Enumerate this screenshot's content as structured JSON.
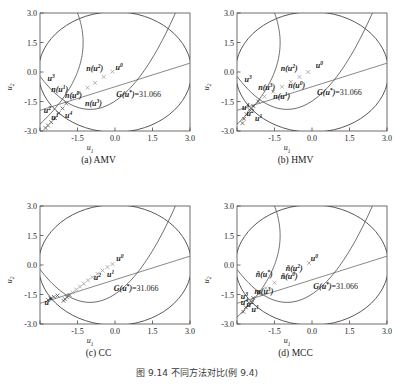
{
  "figure": {
    "caption": "图 9.14   不同方法对比(例 9.4)",
    "colors": {
      "axis": "#4a4a4a",
      "circle": "#3a3a3a",
      "limit_line": "#6b6b6b",
      "curve": "#555555",
      "marker_gray": "#9a9a9a",
      "marker_dark": "#4a4a4a",
      "text": "#1a1a1a"
    }
  },
  "axes": {
    "xlabel": "u1",
    "ylabel": "u2",
    "xticks": [
      "-3.0",
      "-1.5",
      "0.0",
      "1.5",
      "3.0"
    ],
    "yticks": [
      "3.0",
      "1.5",
      "0.0",
      "-1.5",
      "-3.0"
    ],
    "xlim": [
      -3.0,
      3.0
    ],
    "ylim": [
      -3.0,
      3.0
    ]
  },
  "panels": [
    {
      "id": "a",
      "caption": "(a) AMV",
      "glabel": "G(u*)=31.066",
      "glabel_pos": [
        0.05,
        -1.25
      ],
      "markers": [
        {
          "x": -0.1,
          "y": 0.02,
          "type": "cross",
          "tone": "gray"
        },
        {
          "x": -0.45,
          "y": -0.25,
          "type": "cross",
          "tone": "gray"
        },
        {
          "x": -0.8,
          "y": -0.55,
          "type": "cross",
          "tone": "gray"
        },
        {
          "x": -1.1,
          "y": -0.8,
          "type": "cross",
          "tone": "gray"
        },
        {
          "x": -1.45,
          "y": -1.05,
          "type": "cross",
          "tone": "gray"
        },
        {
          "x": -1.7,
          "y": -1.3,
          "type": "cross",
          "tone": "gray"
        },
        {
          "x": -1.95,
          "y": -1.6,
          "type": "cross",
          "tone": "dark"
        },
        {
          "x": -2.1,
          "y": -1.85,
          "type": "cross",
          "tone": "dark"
        },
        {
          "x": -2.25,
          "y": -2.1,
          "type": "cross",
          "tone": "dark"
        },
        {
          "x": -2.4,
          "y": -2.35,
          "type": "cross",
          "tone": "dark"
        },
        {
          "x": -2.55,
          "y": -2.55,
          "type": "cross",
          "tone": "dark"
        },
        {
          "x": -2.68,
          "y": -2.72,
          "type": "cross",
          "tone": "dark"
        },
        {
          "x": -2.78,
          "y": -2.85,
          "type": "cross",
          "tone": "dark"
        }
      ],
      "labels": [
        {
          "text": "u",
          "sup": "0",
          "x": 0.02,
          "y": 0.1
        },
        {
          "text": "n(u",
          "sup": "2",
          "close": ")",
          "x": -1.15,
          "y": 0.05
        },
        {
          "text": "u",
          "sup": "3",
          "x": -2.7,
          "y": -0.45
        },
        {
          "text": "n(u",
          "sup": "1",
          "close": ")",
          "x": -2.55,
          "y": -1.0
        },
        {
          "text": "n(u",
          "sup": "0",
          "close": ")",
          "x": -2.0,
          "y": -1.3
        },
        {
          "text": "n(u",
          "sup": "3",
          "close": ")",
          "x": -1.2,
          "y": -1.75
        },
        {
          "text": "u",
          "sup": "2",
          "x": -2.85,
          "y": -2.1
        },
        {
          "text": "u",
          "sup": "1",
          "x": -2.55,
          "y": -2.45
        },
        {
          "text": "u",
          "sup": "4",
          "x": -2.0,
          "y": -2.35
        }
      ]
    },
    {
      "id": "b",
      "caption": "(b) HMV",
      "glabel": "G(u*)=31.066",
      "glabel_pos": [
        0.2,
        -1.15
      ],
      "markers": [
        {
          "x": -0.15,
          "y": 0.0,
          "type": "cross",
          "tone": "gray"
        },
        {
          "x": -0.5,
          "y": -0.25,
          "type": "cross",
          "tone": "gray"
        },
        {
          "x": -0.85,
          "y": -0.5,
          "type": "cross",
          "tone": "gray"
        },
        {
          "x": -1.2,
          "y": -0.75,
          "type": "cross",
          "tone": "gray"
        },
        {
          "x": -1.55,
          "y": -1.0,
          "type": "cross",
          "tone": "gray"
        },
        {
          "x": -1.9,
          "y": -1.25,
          "type": "cross",
          "tone": "gray"
        },
        {
          "x": -2.15,
          "y": -1.5,
          "type": "cross",
          "tone": "dark"
        },
        {
          "x": -2.35,
          "y": -1.72,
          "type": "cross",
          "tone": "dark"
        },
        {
          "x": -2.5,
          "y": -1.92,
          "type": "cross",
          "tone": "dark"
        },
        {
          "x": -2.62,
          "y": -2.15,
          "type": "cross",
          "tone": "dark"
        },
        {
          "x": -2.72,
          "y": -2.38,
          "type": "cross",
          "tone": "dark"
        },
        {
          "x": -2.78,
          "y": -2.6,
          "type": "cross",
          "tone": "dark"
        }
      ],
      "labels": [
        {
          "text": "u",
          "sup": "0",
          "x": 0.15,
          "y": 0.18
        },
        {
          "text": "n(u",
          "sup": "2",
          "close": ")",
          "x": -1.25,
          "y": 0.05
        },
        {
          "text": "u",
          "sup": "3",
          "x": -2.7,
          "y": -0.52
        },
        {
          "text": "n(u",
          "sup": "3",
          "close": ")",
          "x": -2.15,
          "y": -0.92
        },
        {
          "text": "n(u",
          "sup": "0",
          "close": ")",
          "x": -0.95,
          "y": -0.82
        },
        {
          "text": "n(u",
          "sup": "1",
          "close": ")",
          "x": -1.55,
          "y": -1.35
        },
        {
          "text": "u",
          "sup": "4",
          "x": -2.8,
          "y": -1.92
        },
        {
          "text": "u",
          "sup": "2",
          "x": -2.62,
          "y": -2.22
        },
        {
          "text": "u",
          "sup": "1",
          "x": -2.28,
          "y": -2.48
        }
      ]
    },
    {
      "id": "c",
      "caption": "(c) CC",
      "glabel": "G(u*)=31.066",
      "glabel_pos": [
        -0.05,
        -1.3
      ],
      "markers": [
        {
          "x": -0.1,
          "y": 0.05,
          "type": "cross",
          "tone": "gray"
        },
        {
          "x": -0.3,
          "y": -0.1,
          "type": "cross",
          "tone": "gray"
        },
        {
          "x": -0.5,
          "y": -0.28,
          "type": "cross",
          "tone": "gray"
        },
        {
          "x": -0.7,
          "y": -0.45,
          "type": "cross",
          "tone": "gray"
        },
        {
          "x": -0.9,
          "y": -0.62,
          "type": "cross",
          "tone": "gray"
        },
        {
          "x": -1.08,
          "y": -0.78,
          "type": "cross",
          "tone": "gray"
        },
        {
          "x": -1.25,
          "y": -0.95,
          "type": "cross",
          "tone": "gray"
        },
        {
          "x": -1.4,
          "y": -1.1,
          "type": "cross",
          "tone": "gray"
        },
        {
          "x": -1.55,
          "y": -1.25,
          "type": "cross",
          "tone": "gray"
        },
        {
          "x": -1.7,
          "y": -1.4,
          "type": "cross",
          "tone": "gray"
        },
        {
          "x": -1.82,
          "y": -1.52,
          "type": "cross",
          "tone": "dark"
        },
        {
          "x": -1.92,
          "y": -1.64,
          "type": "cross",
          "tone": "dark"
        },
        {
          "x": -2.0,
          "y": -1.74,
          "type": "cross",
          "tone": "dark"
        },
        {
          "x": -2.06,
          "y": -1.82,
          "type": "cross",
          "tone": "dark"
        },
        {
          "x": -2.3,
          "y": -1.55,
          "type": "cross",
          "tone": "dark"
        },
        {
          "x": -2.45,
          "y": -1.62,
          "type": "cross",
          "tone": "dark"
        },
        {
          "x": -2.58,
          "y": -1.7,
          "type": "cross",
          "tone": "dark"
        },
        {
          "x": -2.68,
          "y": -1.78,
          "type": "cross",
          "tone": "dark"
        }
      ],
      "labels": [
        {
          "text": "u",
          "sup": "0",
          "x": 0.05,
          "y": 0.22
        },
        {
          "text": "u",
          "sup": "1",
          "x": -0.32,
          "y": -0.62
        },
        {
          "text": "u",
          "sup": "2",
          "x": -0.85,
          "y": -0.78
        },
        {
          "text": "u",
          "sup": "*",
          "x": -2.82,
          "y": -2.05
        }
      ]
    },
    {
      "id": "d",
      "caption": "(d) MCC",
      "glabel": "G(u*)=31.066",
      "glabel_pos": [
        0.05,
        -1.22
      ],
      "markers": [
        {
          "x": -0.12,
          "y": 0.1,
          "type": "cross",
          "tone": "gray"
        },
        {
          "x": -0.7,
          "y": -0.35,
          "type": "cross",
          "tone": "gray"
        },
        {
          "x": -1.1,
          "y": -0.62,
          "type": "cross",
          "tone": "gray"
        },
        {
          "x": -1.5,
          "y": -0.9,
          "type": "cross",
          "tone": "gray"
        },
        {
          "x": -1.85,
          "y": -1.18,
          "type": "cross",
          "tone": "gray"
        },
        {
          "x": -2.12,
          "y": -1.45,
          "type": "cross",
          "tone": "dark"
        },
        {
          "x": -2.35,
          "y": -1.68,
          "type": "cross",
          "tone": "dark"
        },
        {
          "x": -2.52,
          "y": -1.92,
          "type": "cross",
          "tone": "dark"
        },
        {
          "x": -2.65,
          "y": -2.15,
          "type": "cross",
          "tone": "dark"
        },
        {
          "x": -2.75,
          "y": -2.38,
          "type": "cross",
          "tone": "dark"
        }
      ],
      "labels": [
        {
          "text": "u",
          "sup": "0",
          "x": -0.05,
          "y": 0.22
        },
        {
          "text": "ñ(u",
          "sup": "*",
          "close": ")",
          "x": -2.25,
          "y": -0.62
        },
        {
          "text": "ñ(u",
          "sup": "0",
          "close": ")",
          "x": -1.25,
          "y": -0.72
        },
        {
          "text": "ñ(u",
          "sup": "2",
          "close": ")",
          "x": -1.05,
          "y": -0.32
        },
        {
          "text": "m(u",
          "sup": "3",
          "close": ")",
          "x": -2.3,
          "y": -1.45
        },
        {
          "text": "u",
          "sup": "3",
          "x": -2.85,
          "y": -1.72
        },
        {
          "text": "u",
          "sup": "4",
          "x": -2.85,
          "y": -2.02
        },
        {
          "text": "u",
          "sup": "2",
          "x": -2.62,
          "y": -2.12
        },
        {
          "text": "u",
          "sup": "1",
          "x": -2.42,
          "y": -2.4
        }
      ]
    }
  ],
  "chart_data": {
    "type": "scatter",
    "title": "图 9.14 不同方法对比(例 9.4)",
    "xlabel": "u1",
    "ylabel": "u2",
    "xlim": [
      -3.0,
      3.0
    ],
    "ylim": [
      -3.0,
      3.0
    ],
    "xticks": [
      -3.0,
      -1.5,
      0.0,
      1.5,
      3.0
    ],
    "yticks": [
      -3.0,
      -1.5,
      0.0,
      1.5,
      3.0
    ],
    "grid": false,
    "legend": "none",
    "annotations": [
      "G(u*)=31.066"
    ],
    "reliability_circle_radius": 3.066,
    "subplots": [
      {
        "name": "(a) AMV",
        "n_iterations": 13
      },
      {
        "name": "(b) HMV",
        "n_iterations": 12
      },
      {
        "name": "(c) CC",
        "n_iterations": 18
      },
      {
        "name": "(d) MCC",
        "n_iterations": 10
      }
    ]
  }
}
